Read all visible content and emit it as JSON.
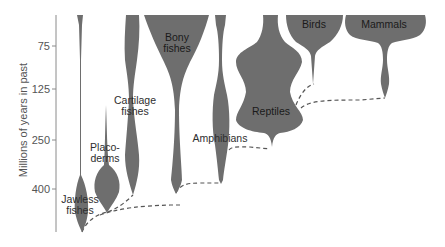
{
  "diagram": {
    "type": "spindle-diagram",
    "y_axis": {
      "title": "Millions of years in past",
      "ticks": [
        {
          "label": "75",
          "y": 46
        },
        {
          "label": "125",
          "y": 89
        },
        {
          "label": "250",
          "y": 140
        },
        {
          "label": "400",
          "y": 189
        }
      ]
    },
    "groups": [
      {
        "id": "jawless",
        "label_line1": "Jawless",
        "label_line2": "fishes"
      },
      {
        "id": "placoderms",
        "label_line1": "Placo-",
        "label_line2": "derms"
      },
      {
        "id": "cartilage",
        "label_line1": "Cartilage",
        "label_line2": "fishes"
      },
      {
        "id": "bony",
        "label_line1": "Bony",
        "label_line2": "fishes"
      },
      {
        "id": "amphibians",
        "label_line1": "Amphibians",
        "label_line2": ""
      },
      {
        "id": "reptiles",
        "label_line1": "Reptiles",
        "label_line2": ""
      },
      {
        "id": "birds",
        "label_line1": "Birds",
        "label_line2": ""
      },
      {
        "id": "mammals",
        "label_line1": "Mammals",
        "label_line2": ""
      }
    ],
    "colors": {
      "spindle_fill": "#6e6e6e",
      "axis": "#8a8a8a",
      "connector": "#555555",
      "background": "#ffffff"
    }
  }
}
